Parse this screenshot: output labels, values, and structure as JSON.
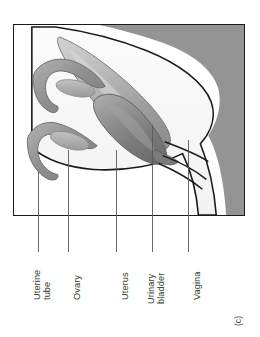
{
  "figure": {
    "panel_letter": "(c)",
    "frame": {
      "border_color": "#1a1a1a",
      "background": "#ffffff"
    },
    "background_region_color": "#949494",
    "organ_colors": {
      "uterus": "#8a8a8a",
      "urinary_bladder": "#b0b0b0",
      "uterine_tube": "#9a9a9a",
      "ovary": "#b4b4b4",
      "outline": "#1a1a1a"
    },
    "leader_line_color": "#5a5a5a"
  },
  "labels": [
    {
      "name": "uterine-tube",
      "lines": [
        "Uterine",
        "tube"
      ]
    },
    {
      "name": "ovary",
      "lines": [
        "Ovary"
      ]
    },
    {
      "name": "uterus",
      "lines": [
        "Uterus"
      ]
    },
    {
      "name": "urinary-bladder",
      "lines": [
        "Urinary",
        "bladder"
      ]
    },
    {
      "name": "vagina",
      "lines": [
        "Vagina"
      ]
    }
  ]
}
